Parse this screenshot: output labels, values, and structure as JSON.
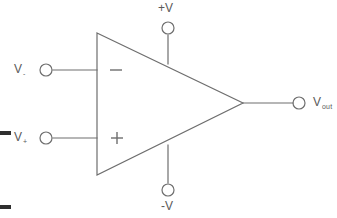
{
  "diagram": {
    "type": "circuit-schematic",
    "stroke_color": "#6e6e6e",
    "text_color": "#5a5a5a",
    "background_color": "#ffffff"
  },
  "terminals": {
    "inverting_input": {
      "label_base": "V",
      "label_sub": "-",
      "symbol": "−",
      "node_x": 46,
      "node_y": 70
    },
    "noninverting_input": {
      "label_base": "V",
      "label_sub": "+",
      "symbol": "+",
      "node_x": 46,
      "node_y": 138
    },
    "output": {
      "label_base": "V",
      "label_sub": "out",
      "node_x": 299,
      "node_y": 103
    },
    "positive_supply": {
      "label": "+V",
      "node_x": 168,
      "node_y": 28
    },
    "negative_supply": {
      "label": "-V",
      "node_x": 168,
      "node_y": 190
    }
  },
  "body": {
    "shape": "triangle",
    "vertex_top_left_x": 97,
    "vertex_top_left_y": 33,
    "vertex_bottom_left_x": 97,
    "vertex_bottom_left_y": 175,
    "vertex_apex_x": 243,
    "vertex_apex_y": 103
  }
}
